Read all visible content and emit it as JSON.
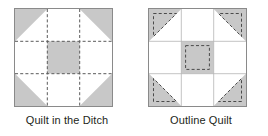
{
  "figure": {
    "background": "#ffffff",
    "patch_fill": "#c8c8c8",
    "patch_white": "#ffffff",
    "border_color": "#8a8a8a",
    "stitch_color": "#5a5a5a",
    "text_color": "#231f20"
  },
  "blocks": [
    {
      "id": "quilt-in-the-ditch",
      "caption": "Quilt in the Ditch",
      "grid": 3,
      "stitch_style": "in-the-ditch",
      "stitch_description": "dashed stitching lines run along every seam of the 3x3 grid",
      "patches": [
        {
          "row": 0,
          "col": 0,
          "type": "half-square-triangle",
          "fill": "#c8c8c8",
          "diagonal": "tl-br",
          "gray_side": "upper-left"
        },
        {
          "row": 0,
          "col": 1,
          "type": "square",
          "fill": "#ffffff"
        },
        {
          "row": 0,
          "col": 2,
          "type": "half-square-triangle",
          "fill": "#c8c8c8",
          "diagonal": "bl-tr",
          "gray_side": "upper-right"
        },
        {
          "row": 1,
          "col": 0,
          "type": "square",
          "fill": "#ffffff"
        },
        {
          "row": 1,
          "col": 1,
          "type": "square",
          "fill": "#c8c8c8"
        },
        {
          "row": 1,
          "col": 2,
          "type": "square",
          "fill": "#ffffff"
        },
        {
          "row": 2,
          "col": 0,
          "type": "half-square-triangle",
          "fill": "#c8c8c8",
          "diagonal": "bl-tr",
          "gray_side": "lower-left"
        },
        {
          "row": 2,
          "col": 1,
          "type": "square",
          "fill": "#ffffff"
        },
        {
          "row": 2,
          "col": 2,
          "type": "half-square-triangle",
          "fill": "#c8c8c8",
          "diagonal": "tl-br",
          "gray_side": "lower-right"
        }
      ]
    },
    {
      "id": "outline-quilt",
      "caption": "Outline Quilt",
      "grid": 3,
      "stitch_style": "outline",
      "stitch_description": "dashed stitching lines are set inside each gray patch, echoing its outline",
      "patches": [
        {
          "row": 0,
          "col": 0,
          "type": "half-square-triangle",
          "fill": "#c8c8c8",
          "diagonal": "tl-br",
          "gray_side": "upper-left"
        },
        {
          "row": 0,
          "col": 1,
          "type": "square",
          "fill": "#ffffff"
        },
        {
          "row": 0,
          "col": 2,
          "type": "half-square-triangle",
          "fill": "#c8c8c8",
          "diagonal": "bl-tr",
          "gray_side": "upper-right"
        },
        {
          "row": 1,
          "col": 0,
          "type": "square",
          "fill": "#ffffff"
        },
        {
          "row": 1,
          "col": 1,
          "type": "square",
          "fill": "#c8c8c8"
        },
        {
          "row": 1,
          "col": 2,
          "type": "square",
          "fill": "#ffffff"
        },
        {
          "row": 2,
          "col": 0,
          "type": "half-square-triangle",
          "fill": "#c8c8c8",
          "diagonal": "bl-tr",
          "gray_side": "lower-left"
        },
        {
          "row": 2,
          "col": 1,
          "type": "square",
          "fill": "#ffffff"
        },
        {
          "row": 2,
          "col": 2,
          "type": "half-square-triangle",
          "fill": "#c8c8c8",
          "diagonal": "tl-br",
          "gray_side": "lower-right"
        }
      ]
    }
  ]
}
